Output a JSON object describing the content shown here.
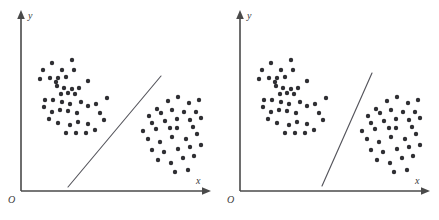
{
  "figure": {
    "type": "scatter-pair",
    "background_color": "#ffffff",
    "point_color": "#2f2f33",
    "axis_color": "#4a4a4a",
    "line_color": "#55555c",
    "point_radius": 2.2
  },
  "chart_data": [
    {
      "type": "scatter",
      "title": "",
      "panel_name": "left-panel",
      "xlabel": "x",
      "ylabel": "y",
      "origin_label": "O",
      "grid": false,
      "legend": "none",
      "axis_origin": [
        21,
        191
      ],
      "xlim": [
        21,
        212
      ],
      "ylim": [
        12,
        191
      ],
      "series": [
        {
          "name": "cluster-a",
          "points": [
            [
              43,
              70
            ],
            [
              52,
              63
            ],
            [
              62,
              70
            ],
            [
              72,
              60
            ],
            [
              74,
              70
            ],
            [
              40,
              79
            ],
            [
              50,
              78
            ],
            [
              58,
              78
            ],
            [
              66,
              77
            ],
            [
              88,
              81
            ],
            [
              56,
              82
            ],
            [
              57,
              86
            ],
            [
              64,
              88
            ],
            [
              72,
              89
            ],
            [
              79,
              88
            ],
            [
              61,
              94
            ],
            [
              68,
              93
            ],
            [
              75,
              94
            ],
            [
              45,
              100
            ],
            [
              53,
              100
            ],
            [
              62,
              102
            ],
            [
              70,
              104
            ],
            [
              81,
              102
            ],
            [
              44,
              107
            ],
            [
              52,
              112
            ],
            [
              60,
              110
            ],
            [
              68,
              111
            ],
            [
              77,
              113
            ],
            [
              88,
              106
            ],
            [
              96,
              104
            ],
            [
              107,
              98
            ],
            [
              100,
              113
            ],
            [
              104,
              120
            ],
            [
              49,
              119
            ],
            [
              58,
              123
            ],
            [
              70,
              125
            ],
            [
              78,
              122
            ],
            [
              88,
              124
            ],
            [
              66,
              133
            ],
            [
              76,
              133
            ],
            [
              86,
              133
            ],
            [
              95,
              130
            ]
          ]
        },
        {
          "name": "cluster-b",
          "points": [
            [
              157,
              109
            ],
            [
              168,
              101
            ],
            [
              178,
              97
            ],
            [
              189,
              103
            ],
            [
              199,
              100
            ],
            [
              149,
              116
            ],
            [
              161,
              113
            ],
            [
              172,
              110
            ],
            [
              184,
              112
            ],
            [
              196,
              112
            ],
            [
              152,
              123
            ],
            [
              165,
              121
            ],
            [
              177,
              119
            ],
            [
              190,
              120
            ],
            [
              201,
              118
            ],
            [
              143,
              131
            ],
            [
              156,
              129
            ],
            [
              170,
              128
            ],
            [
              177,
              128
            ],
            [
              193,
              127
            ],
            [
              148,
              139
            ],
            [
              160,
              142
            ],
            [
              172,
              137
            ],
            [
              186,
              139
            ],
            [
              197,
              134
            ],
            [
              152,
              150
            ],
            [
              164,
              152
            ],
            [
              178,
              149
            ],
            [
              190,
              147
            ],
            [
              201,
              145
            ],
            [
              158,
              160
            ],
            [
              171,
              163
            ],
            [
              183,
              158
            ],
            [
              194,
              156
            ],
            [
              175,
              172
            ],
            [
              188,
              170
            ]
          ]
        }
      ],
      "separating_line": {
        "name": "decision-boundary",
        "x1": 68,
        "y1": 187,
        "x2": 161,
        "y2": 76,
        "orientation": "diagonal-moderate-slope"
      }
    },
    {
      "type": "scatter",
      "title": "",
      "panel_name": "right-panel",
      "xlabel": "x",
      "ylabel": "y",
      "origin_label": "O",
      "grid": false,
      "legend": "none",
      "axis_origin": [
        240,
        191
      ],
      "xlim": [
        240,
        431
      ],
      "ylim": [
        12,
        191
      ],
      "series": [
        {
          "name": "cluster-a",
          "points": [
            [
              262,
              70
            ],
            [
              271,
              63
            ],
            [
              281,
              70
            ],
            [
              291,
              60
            ],
            [
              293,
              70
            ],
            [
              259,
              79
            ],
            [
              269,
              78
            ],
            [
              277,
              78
            ],
            [
              285,
              77
            ],
            [
              307,
              81
            ],
            [
              275,
              82
            ],
            [
              276,
              86
            ],
            [
              283,
              88
            ],
            [
              291,
              89
            ],
            [
              298,
              88
            ],
            [
              280,
              94
            ],
            [
              287,
              93
            ],
            [
              294,
              94
            ],
            [
              264,
              100
            ],
            [
              272,
              100
            ],
            [
              281,
              102
            ],
            [
              289,
              104
            ],
            [
              300,
              102
            ],
            [
              263,
              107
            ],
            [
              271,
              112
            ],
            [
              279,
              110
            ],
            [
              287,
              111
            ],
            [
              296,
              113
            ],
            [
              307,
              106
            ],
            [
              315,
              104
            ],
            [
              326,
              98
            ],
            [
              319,
              113
            ],
            [
              323,
              120
            ],
            [
              268,
              119
            ],
            [
              277,
              123
            ],
            [
              289,
              125
            ],
            [
              297,
              122
            ],
            [
              307,
              124
            ],
            [
              285,
              133
            ],
            [
              295,
              133
            ],
            [
              305,
              133
            ],
            [
              314,
              130
            ]
          ]
        },
        {
          "name": "cluster-b",
          "points": [
            [
              376,
              109
            ],
            [
              387,
              101
            ],
            [
              397,
              97
            ],
            [
              408,
              103
            ],
            [
              418,
              100
            ],
            [
              368,
              116
            ],
            [
              380,
              113
            ],
            [
              391,
              110
            ],
            [
              403,
              112
            ],
            [
              415,
              112
            ],
            [
              371,
              123
            ],
            [
              384,
              121
            ],
            [
              396,
              119
            ],
            [
              409,
              120
            ],
            [
              420,
              118
            ],
            [
              362,
              131
            ],
            [
              375,
              129
            ],
            [
              389,
              128
            ],
            [
              396,
              128
            ],
            [
              412,
              127
            ],
            [
              367,
              139
            ],
            [
              379,
              142
            ],
            [
              391,
              137
            ],
            [
              405,
              139
            ],
            [
              416,
              134
            ],
            [
              371,
              150
            ],
            [
              383,
              152
            ],
            [
              397,
              149
            ],
            [
              409,
              147
            ],
            [
              420,
              145
            ],
            [
              377,
              160
            ],
            [
              390,
              163
            ],
            [
              402,
              158
            ],
            [
              413,
              156
            ],
            [
              394,
              172
            ],
            [
              407,
              170
            ]
          ]
        }
      ],
      "separating_line": {
        "name": "decision-boundary",
        "x1": 322,
        "y1": 186,
        "x2": 372,
        "y2": 73,
        "orientation": "diagonal-steep-slope"
      }
    }
  ]
}
